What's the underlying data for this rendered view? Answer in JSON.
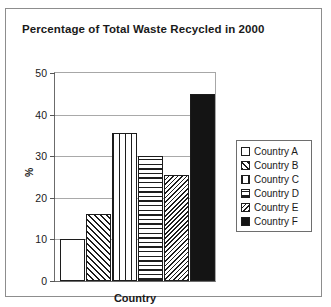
{
  "figure": {
    "title": "Percentage of Total Waste Recycled in 2000"
  },
  "chart_data": {
    "type": "bar",
    "title": "Percentage of Total Waste Recycled in 2000",
    "xlabel": "Country",
    "ylabel": "%",
    "categories": [
      "Country A",
      "Country B",
      "Country C",
      "Country D",
      "Country E",
      "Country F"
    ],
    "values": [
      10,
      16,
      35.5,
      30,
      25.5,
      45
    ],
    "ylim": [
      0,
      50
    ],
    "yticks": [
      0,
      10,
      20,
      30,
      40,
      50
    ],
    "ytick_labels": [
      "0",
      "10",
      "20",
      "30",
      "40",
      "50"
    ],
    "grid": true,
    "legend_position": "right",
    "series": [
      {
        "name": "Country A",
        "value": 10,
        "pattern": "empty"
      },
      {
        "name": "Country B",
        "value": 16,
        "pattern": "diagonal-hatch"
      },
      {
        "name": "Country C",
        "value": 35.5,
        "pattern": "vertical-lines"
      },
      {
        "name": "Country D",
        "value": 30,
        "pattern": "horizontal-lines"
      },
      {
        "name": "Country E",
        "value": 25.5,
        "pattern": "fine-diagonal-hatch"
      },
      {
        "name": "Country F",
        "value": 45,
        "pattern": "solid"
      }
    ]
  },
  "legend": {
    "items": [
      {
        "label": "Country A"
      },
      {
        "label": "Country B"
      },
      {
        "label": "Country C"
      },
      {
        "label": "Country D"
      },
      {
        "label": "Country E"
      },
      {
        "label": "Country F"
      }
    ]
  }
}
